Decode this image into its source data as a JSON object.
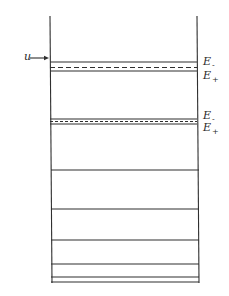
{
  "diagram": {
    "type": "energy-level diagram",
    "input_label": "u",
    "well": {
      "left_x": 50,
      "right_x": 197,
      "top_y": 16,
      "bottom_y": 283
    },
    "arrow": {
      "from_x": 30,
      "to_x": 49,
      "y": 58
    },
    "doublets": [
      {
        "upper_y": 62,
        "dashed_y": 67.5,
        "lower_y": 71,
        "labels": [
          {
            "text": "E",
            "sub": "-",
            "y": 56
          },
          {
            "text": "E",
            "sub": "+",
            "y": 71
          }
        ]
      },
      {
        "upper_y": 119,
        "dashed_y": 121.5,
        "lower_y": 124,
        "labels": [
          {
            "text": "E",
            "sub": "-",
            "y": 111
          },
          {
            "text": "E",
            "sub": "+",
            "y": 124
          }
        ]
      }
    ],
    "levels_y": [
      170,
      209,
      240,
      264,
      277,
      282
    ],
    "line_color": "#2f2f2f"
  }
}
